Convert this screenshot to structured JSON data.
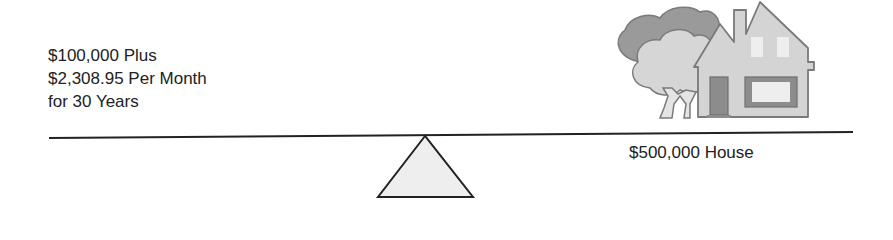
{
  "left_side": {
    "lines": [
      "$100,000 Plus",
      "$2,308.95 Per Month",
      "for 30 Years"
    ]
  },
  "right_side": {
    "label": "$500,000 House",
    "illustration": "house-with-tree-icon"
  },
  "balance": {
    "beam": "balance-beam",
    "fulcrum": "fulcrum-triangle"
  },
  "colors": {
    "line": "#222222",
    "fulcrum_fill": "#eeeeee",
    "house_fill": "#d4d4d4",
    "tree_dark": "#9a9a9a",
    "tree_light": "#d6d6d6",
    "outline": "#7a7a7a"
  }
}
